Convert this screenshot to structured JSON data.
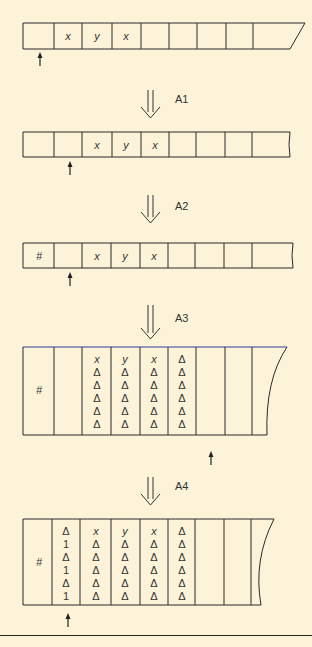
{
  "diagram": {
    "colors": {
      "background": "#fdf3d8",
      "line": "#2a2a2a",
      "highlight_line": "#3a3aa0"
    },
    "steps": [
      {
        "id": "tape-0",
        "cells": [
          "",
          "x",
          "y",
          "x",
          "",
          "",
          "",
          "",
          ""
        ],
        "head_position": 0
      },
      {
        "transition_label": "A1"
      },
      {
        "id": "tape-1",
        "cells": [
          "",
          "",
          "x",
          "y",
          "x",
          "",
          "",
          "",
          ""
        ],
        "head_position": 1
      },
      {
        "transition_label": "A2"
      },
      {
        "id": "tape-2",
        "cells": [
          "#",
          "",
          "x",
          "y",
          "x",
          "",
          "",
          "",
          ""
        ],
        "head_position": 1
      },
      {
        "transition_label": "A3"
      },
      {
        "id": "tape-3",
        "cells": [
          [
            "#"
          ],
          [],
          [
            "x",
            "Δ",
            "Δ",
            "Δ",
            "Δ",
            "Δ"
          ],
          [
            "y",
            "Δ",
            "Δ",
            "Δ",
            "Δ",
            "Δ"
          ],
          [
            "x",
            "Δ",
            "Δ",
            "Δ",
            "Δ",
            "Δ"
          ],
          [
            "Δ",
            "Δ",
            "Δ",
            "Δ",
            "Δ",
            "Δ"
          ],
          [],
          [],
          []
        ],
        "head_position": 6
      },
      {
        "transition_label": "A4"
      },
      {
        "id": "tape-4",
        "cells": [
          [
            "#"
          ],
          [
            "Δ",
            "1",
            "Δ",
            "1",
            "Δ",
            "1"
          ],
          [
            "x",
            "Δ",
            "Δ",
            "Δ",
            "Δ",
            "Δ"
          ],
          [
            "y",
            "Δ",
            "Δ",
            "Δ",
            "Δ",
            "Δ"
          ],
          [
            "x",
            "Δ",
            "Δ",
            "Δ",
            "Δ",
            "Δ"
          ],
          [
            "Δ",
            "Δ",
            "Δ",
            "Δ",
            "Δ",
            "Δ"
          ],
          [],
          [],
          []
        ],
        "head_position": 1
      }
    ],
    "labels": {
      "a1": "A1",
      "a2": "A2",
      "a3": "A3",
      "a4": "A4",
      "hash": "#",
      "x": "x",
      "y": "y",
      "delta": "Δ",
      "one": "1"
    }
  }
}
